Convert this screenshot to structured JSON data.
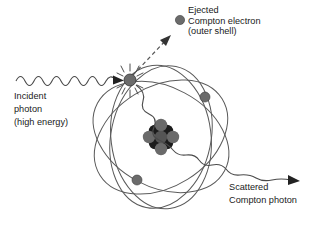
{
  "figure": {
    "background_color": "#ffffff",
    "stroke_color": "#555555",
    "text_color": "#1a1a1a",
    "electron_color": "#6b6b6b",
    "nucleus_dark_color": "#1c1c1c",
    "nucleus_gray_color": "#666666"
  },
  "labels": {
    "incident": {
      "line1": "Incident",
      "line2": "photon",
      "line3": "(high energy)"
    },
    "ejected": {
      "line1": "Ejected",
      "line2": "Compton electron",
      "line3": "(outer shell)"
    },
    "scattered": {
      "line1": "Scattered",
      "line2": "Compton photon"
    }
  },
  "elements": {
    "incident_photon_wave": "incident-photon-wave",
    "incident_photon_arrow": "incident-photon-arrowhead",
    "collision_electron": "collision-electron",
    "collision_starburst": "collision-starburst",
    "ejection_arrow": "ejected-electron-dashed-arrow",
    "scattered_photon_wave": "scattered-photon-wave",
    "scattered_photon_arrow": "scattered-photon-arrowhead",
    "nucleus": "atomic-nucleus",
    "orbit_count": 4,
    "orbital_electrons": 2,
    "legend_electron_marker": "ejected-electron-marker"
  }
}
